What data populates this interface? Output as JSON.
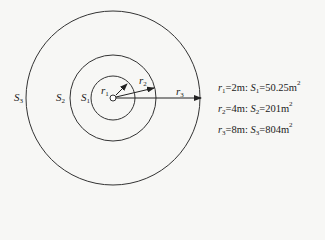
{
  "diagram": {
    "center": {
      "x": 113,
      "y": 98
    },
    "circles": [
      {
        "id": "r1",
        "radius_px": 22,
        "area_label": "S1"
      },
      {
        "id": "r2",
        "radius_px": 43,
        "area_label": "S2"
      },
      {
        "id": "r3",
        "radius_px": 87,
        "area_label": "S3"
      }
    ],
    "stroke_color": "#333333",
    "background_color": "#f7f7f5"
  },
  "labels": {
    "S3": {
      "base": "S",
      "sub": "3"
    },
    "S2": {
      "base": "S",
      "sub": "2"
    },
    "S1": {
      "base": "S",
      "sub": "1"
    },
    "r1": {
      "base": "r",
      "sub": "1"
    },
    "r2": {
      "base": "r",
      "sub": "2"
    },
    "r3": {
      "base": "r",
      "sub": "3"
    }
  },
  "legend": [
    {
      "r_base": "r",
      "r_sub": "1",
      "r_value": "=2m",
      "sep": ":",
      "s_base": "S",
      "s_sub": "1",
      "s_value": "=50.25m",
      "unit_sup": "2"
    },
    {
      "r_base": "r",
      "r_sub": "2",
      "r_value": "=4m",
      "sep": ":",
      "s_base": "S",
      "s_sub": "2",
      "s_value": "=201m",
      "unit_sup": "2"
    },
    {
      "r_base": "r",
      "r_sub": "3",
      "r_value": "=8m",
      "sep": ":",
      "s_base": "S",
      "s_sub": "3",
      "s_value": "=804m",
      "unit_sup": "2"
    }
  ]
}
